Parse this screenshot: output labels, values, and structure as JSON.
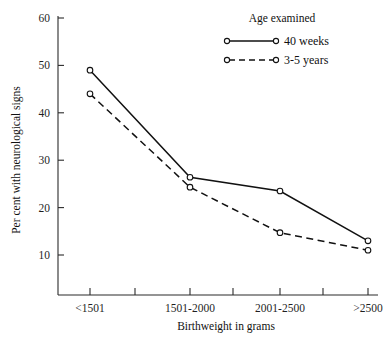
{
  "chart_data": {
    "type": "line",
    "title": "",
    "xlabel": "Birthweight in grams",
    "ylabel": "Per cent with neurological signs",
    "categories": [
      "<1501",
      "1501-2000",
      "2001-2500",
      ">2500"
    ],
    "ylim": [
      1.5,
      60
    ],
    "ytick_labels": [
      "10",
      "20",
      "30",
      "40",
      "50",
      "60"
    ],
    "ytick_values": [
      10,
      20,
      30,
      40,
      50,
      60
    ],
    "grid": false,
    "legend_position": "top-right",
    "legend_title": "Age examined",
    "series": [
      {
        "name": "40 weeks",
        "style": "solid",
        "marker": "open-circle",
        "values": [
          49,
          26.4,
          23.5,
          13
        ]
      },
      {
        "name": "3-5 years",
        "style": "dashed",
        "marker": "open-circle",
        "values": [
          44,
          24.3,
          14.7,
          11
        ]
      }
    ],
    "colors": {
      "axis": "#2b2b2b",
      "series": "#111111",
      "background": "#ffffff"
    }
  },
  "axes": {
    "y_title": "Per cent with neurological signs",
    "x_title": "Birthweight in grams",
    "y_ticks": [
      {
        "label": "60",
        "value": 60
      },
      {
        "label": "50",
        "value": 50
      },
      {
        "label": "40",
        "value": 40
      },
      {
        "label": "30",
        "value": 30
      },
      {
        "label": "20",
        "value": 20
      },
      {
        "label": "10",
        "value": 10
      }
    ],
    "x_ticks": [
      {
        "label": "<1501"
      },
      {
        "label": "1501-2000"
      },
      {
        "label": "2001-2500"
      },
      {
        "label": ">2500"
      }
    ]
  },
  "legend": {
    "title": "Age examined",
    "entries": [
      {
        "label": "40 weeks",
        "style": "solid"
      },
      {
        "label": "3-5 years",
        "style": "dashed"
      }
    ]
  }
}
